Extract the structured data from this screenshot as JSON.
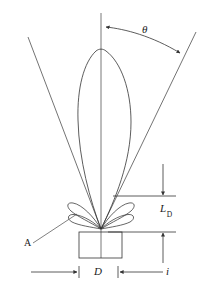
{
  "figure": {
    "type": "technical-diagram",
    "background_color": "#ffffff",
    "line_color": "#333333",
    "text_color": "#1a1a1a",
    "labels": {
      "theta": "θ",
      "ld_base": "L",
      "ld_subscript": "D",
      "aperture": "D",
      "distance": "i",
      "callout": "A"
    },
    "elements": {
      "main_lobe": "main-radiation-lobe",
      "side_lobes": "side-lobes",
      "axis": "boresight-axis",
      "left_beam_edge": "left-beam-edge-line",
      "right_beam_edge": "right-beam-edge-line",
      "antenna_box": "antenna-aperture-box",
      "angle_arc": "beamwidth-angle-arc",
      "ld_dimension": "ld-vertical-dimension",
      "d_dimension": "d-horizontal-dimension",
      "i_dimension": "i-horizontal-dimension"
    }
  }
}
